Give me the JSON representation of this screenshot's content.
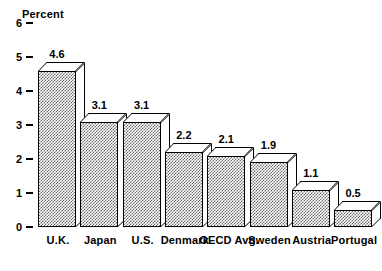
{
  "chart_data": {
    "type": "bar",
    "title": "",
    "ylabel": "Percent",
    "xlabel": "",
    "ylim": [
      0,
      6
    ],
    "yticks": [
      "6",
      "5",
      "4",
      "3",
      "2",
      "1",
      "0"
    ],
    "grid": false,
    "legend": null,
    "categories": [
      "U.K.",
      "Japan",
      "U.S.",
      "Denmark",
      "OECD Avg.",
      "Sweden",
      "Austria",
      "Portugal"
    ],
    "values": [
      4.6,
      3.1,
      3.1,
      2.2,
      2.1,
      1.9,
      1.1,
      0.5
    ],
    "value_labels": [
      "4.6",
      "3.1",
      "3.1",
      "2.2",
      "2.1",
      "1.9",
      "1.1",
      "0.5"
    ],
    "style": {
      "bar_fill": "#6d6d6d",
      "bar_outline": "#000000",
      "bar_top_face": "#ffffff",
      "bar_side_face": "#ffffff",
      "background": "#ffffff",
      "text": "#000000"
    }
  }
}
